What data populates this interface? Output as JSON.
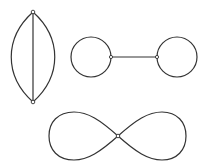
{
  "figure": {
    "stroke_color": "#333333",
    "background_color": "#ffffff",
    "graphs": [
      {
        "name": "lens-graph",
        "vertices": [
          {
            "id": "top",
            "x": 33,
            "y": 12
          },
          {
            "id": "bottom",
            "x": 33,
            "y": 102
          }
        ],
        "edges": [
          {
            "id": "left-arc",
            "from": "top",
            "to": "bottom",
            "type": "curve",
            "bulge": -22
          },
          {
            "id": "straight",
            "from": "top",
            "to": "bottom",
            "type": "line"
          },
          {
            "id": "right-arc",
            "from": "top",
            "to": "bottom",
            "type": "curve",
            "bulge": 22
          }
        ]
      },
      {
        "name": "dumbbell-graph",
        "vertices": [
          {
            "id": "left",
            "x": 111,
            "y": 57
          },
          {
            "id": "right",
            "x": 157,
            "y": 57
          }
        ],
        "loops": [
          {
            "id": "left-loop",
            "vertex": "left",
            "cx": 91,
            "cy": 57,
            "r": 20
          },
          {
            "id": "right-loop",
            "vertex": "right",
            "cx": 177,
            "cy": 57,
            "r": 20
          }
        ],
        "edges": [
          {
            "id": "bridge",
            "from": "left",
            "to": "right",
            "type": "line"
          }
        ]
      },
      {
        "name": "figure-eight-graph",
        "vertices": [
          {
            "id": "center",
            "x": 118,
            "y": 136
          }
        ],
        "loops": [
          {
            "id": "left-lobe",
            "vertex": "center",
            "extent_x": 49,
            "top": 112,
            "bottom": 160
          },
          {
            "id": "right-lobe",
            "vertex": "center",
            "extent_x": 186,
            "top": 112,
            "bottom": 160
          }
        ]
      }
    ]
  }
}
